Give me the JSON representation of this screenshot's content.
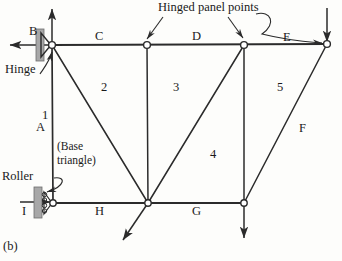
{
  "figure": {
    "label": "(b)",
    "caption_note": "Hinged panel points"
  },
  "supports": [
    {
      "id": "hinge",
      "label": "Hinge",
      "type": "pin",
      "joint": "B"
    },
    {
      "id": "roller",
      "label": "Roller",
      "type": "roller",
      "joint": "I"
    }
  ],
  "joints": [
    {
      "name": "B",
      "x": 52,
      "y": 45
    },
    {
      "name": "C_joint",
      "x": 147,
      "y": 45
    },
    {
      "name": "D_joint",
      "x": 244,
      "y": 45
    },
    {
      "name": "E_end",
      "x": 327,
      "y": 44
    },
    {
      "name": "I",
      "x": 53,
      "y": 203
    },
    {
      "name": "H_joint",
      "x": 148,
      "y": 203
    },
    {
      "name": "G_joint",
      "x": 244,
      "y": 203
    }
  ],
  "member_labels": [
    {
      "text": "A",
      "x": 36,
      "y": 121
    },
    {
      "text": "B",
      "x": 29,
      "y": 25
    },
    {
      "text": "C",
      "x": 95,
      "y": 30
    },
    {
      "text": "D",
      "x": 192,
      "y": 30
    },
    {
      "text": "E",
      "x": 283,
      "y": 31
    },
    {
      "text": "F",
      "x": 299,
      "y": 122
    },
    {
      "text": "G",
      "x": 192,
      "y": 205
    },
    {
      "text": "H",
      "x": 95,
      "y": 205
    },
    {
      "text": "I",
      "x": 22,
      "y": 205
    }
  ],
  "panel_numbers": [
    {
      "text": "1",
      "x": 42,
      "y": 109
    },
    {
      "text": "2",
      "x": 101,
      "y": 81
    },
    {
      "text": "3",
      "x": 173,
      "y": 81
    },
    {
      "text": "4",
      "x": 210,
      "y": 148
    },
    {
      "text": "5",
      "x": 277,
      "y": 81
    }
  ],
  "annotations": {
    "base_triangle_line1": "(Base",
    "base_triangle_line2": "triangle)"
  },
  "colors": {
    "line": "#2b2b2b",
    "background": "#fdfdfb",
    "support_fill": "#a8a8a8",
    "text": "#1a1a1a"
  }
}
